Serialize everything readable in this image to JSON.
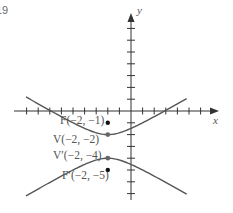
{
  "figure": {
    "number_fragment": "19"
  },
  "chart_data": {
    "type": "line",
    "title": "",
    "xlabel": "x",
    "ylabel": "y",
    "grid": false,
    "equation": "(y+3)^2 - (x+2)^2/3 = 1",
    "center": [
      -2,
      -3
    ],
    "a": 1,
    "b": 1.732,
    "c": 2,
    "xlim": [
      -10,
      7.5
    ],
    "ylim": [
      -7.5,
      8.3
    ],
    "x_ticks": [
      -9,
      -8,
      -7,
      -6,
      -5,
      -4,
      -3,
      -2,
      -1,
      1,
      2,
      3,
      4,
      5,
      6
    ],
    "y_ticks": [
      -7,
      -6,
      -5,
      -4,
      -3,
      -2,
      -1,
      1,
      2,
      3,
      4,
      5,
      6,
      7
    ],
    "branch_x_range": [
      -9.05,
      4.8
    ],
    "points": [
      {
        "name": "F",
        "label": "F(−2, −1)",
        "x": -2,
        "y": -1,
        "kind": "focus"
      },
      {
        "name": "V",
        "label": "V(−2, −2)",
        "x": -2,
        "y": -2,
        "kind": "vertex"
      },
      {
        "name": "V'",
        "label": "V′(−2, −4)",
        "x": -2,
        "y": -4,
        "kind": "vertex"
      },
      {
        "name": "F'",
        "label": "F′(−2, −5)",
        "x": -2,
        "y": -5,
        "kind": "focus"
      }
    ]
  },
  "colors": {
    "curve": "#555555",
    "axis": "#333333",
    "point": "#111111",
    "vertex": "#666666"
  }
}
